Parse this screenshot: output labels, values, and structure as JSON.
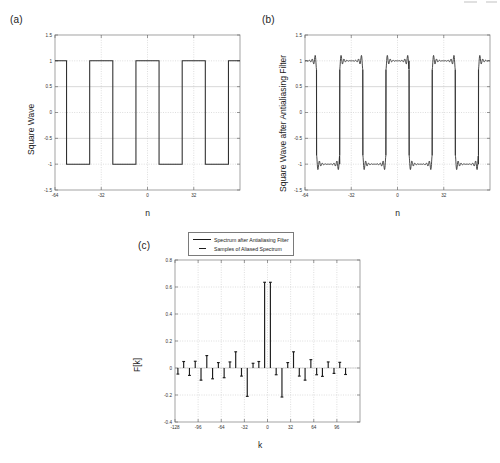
{
  "figure": {
    "panels": [
      {
        "id": "a",
        "label": "(a)"
      },
      {
        "id": "b",
        "label": "(b)"
      },
      {
        "id": "c",
        "label": "(c)"
      }
    ]
  },
  "legend": {
    "items": [
      {
        "label": "Spectrum after Antialiasing Filter",
        "style": "solid"
      },
      {
        "label": "Samples of Aliased Spectrum",
        "style": "dash"
      }
    ]
  },
  "chart_data": [
    {
      "type": "line",
      "panel": "a",
      "title": "",
      "xlabel": "n",
      "ylabel": "Square Wave",
      "xlim": [
        -64,
        64
      ],
      "ylim": [
        -1.5,
        1.5
      ],
      "xticks": [
        -64,
        -32,
        0,
        32
      ],
      "xticklabels": [
        "-64",
        "-32",
        "0",
        "32"
      ],
      "yticks": [
        -1.5,
        -1,
        -0.5,
        0,
        0.5,
        1,
        1.5
      ],
      "yticklabels": [
        "-1.5",
        "-1",
        "-0.5",
        "0",
        "0.5",
        "1",
        "1.5"
      ],
      "grid": true,
      "description": "Ideal square wave, amplitude +/-1, period 32 samples",
      "period": 32,
      "amplitude": 1,
      "series": [
        {
          "name": "Square Wave",
          "x": [
            -64,
            -56,
            -56,
            -40,
            -40,
            -24,
            -24,
            -8,
            -8,
            8,
            8,
            24,
            24,
            40,
            40,
            56,
            56,
            64
          ],
          "y": [
            1,
            1,
            -1,
            -1,
            1,
            1,
            -1,
            -1,
            1,
            1,
            -1,
            -1,
            1,
            1,
            -1,
            -1,
            1,
            1
          ]
        }
      ]
    },
    {
      "type": "line",
      "panel": "b",
      "title": "",
      "xlabel": "n",
      "ylabel": "Square Wave after Antialiasing Filter",
      "xlim": [
        -64,
        64
      ],
      "ylim": [
        -1.5,
        1.5
      ],
      "xticks": [
        -64,
        -32,
        0,
        32
      ],
      "xticklabels": [
        "-64",
        "-32",
        "0",
        "32"
      ],
      "yticks": [
        -1.5,
        -1,
        -0.5,
        0,
        0.5,
        1,
        1.5
      ],
      "yticklabels": [
        "-1.5",
        "-1",
        "-0.5",
        "0",
        "0.5",
        "1",
        "1.5"
      ],
      "grid": true,
      "description": "Square wave after antialiasing filter showing Gibbs ringing near each transition",
      "period": 32,
      "amplitude": 1,
      "gibbs_overshoot": 0.18,
      "ringing_decay": 0.55,
      "ringing_halfwidth": 7,
      "transitions": [
        -56,
        -40,
        -24,
        -8,
        8,
        24,
        40,
        56
      ],
      "levels": [
        1,
        -1,
        1,
        -1,
        1,
        -1,
        1,
        -1,
        1
      ]
    },
    {
      "type": "bar",
      "panel": "c",
      "title": "",
      "xlabel": "k",
      "ylabel": "F[k]",
      "xlim": [
        -128,
        128
      ],
      "ylim": [
        -0.4,
        0.8
      ],
      "xticks": [
        -128,
        -96,
        -64,
        -32,
        0,
        32,
        64,
        96
      ],
      "xticklabels": [
        "-128",
        "-96",
        "-64",
        "-32",
        "0",
        "32",
        "64",
        "96"
      ],
      "yticks": [
        -0.4,
        -0.2,
        0,
        0.2,
        0.4,
        0.6,
        0.8
      ],
      "yticklabels": [
        "-0.4",
        "-0.2",
        "0",
        "0.2",
        "0.4",
        "0.6",
        "0.8"
      ],
      "grid": true,
      "description": "Stem plot of spectrum after antialiasing filter with samples of aliased spectrum",
      "stems": [
        {
          "k": -124,
          "v": -0.045
        },
        {
          "k": -116,
          "v": 0.048
        },
        {
          "k": -108,
          "v": -0.055
        },
        {
          "k": -100,
          "v": 0.05
        },
        {
          "k": -92,
          "v": -0.09
        },
        {
          "k": -84,
          "v": 0.092
        },
        {
          "k": -76,
          "v": -0.08
        },
        {
          "k": -68,
          "v": 0.04
        },
        {
          "k": -60,
          "v": -0.072
        },
        {
          "k": -52,
          "v": 0.045
        },
        {
          "k": -44,
          "v": 0.12
        },
        {
          "k": -36,
          "v": -0.06
        },
        {
          "k": -28,
          "v": -0.21
        },
        {
          "k": -20,
          "v": 0.035
        },
        {
          "k": -12,
          "v": 0.048
        },
        {
          "k": -4,
          "v": 0.635
        },
        {
          "k": 4,
          "v": 0.635
        },
        {
          "k": 12,
          "v": -0.05
        },
        {
          "k": 20,
          "v": -0.215
        },
        {
          "k": 28,
          "v": 0.04
        },
        {
          "k": 36,
          "v": 0.12
        },
        {
          "k": 44,
          "v": -0.06
        },
        {
          "k": 52,
          "v": -0.09
        },
        {
          "k": 60,
          "v": 0.062
        },
        {
          "k": 68,
          "v": -0.05
        },
        {
          "k": 76,
          "v": -0.062
        },
        {
          "k": 84,
          "v": 0.045
        },
        {
          "k": 92,
          "v": -0.04
        },
        {
          "k": 100,
          "v": 0.042
        },
        {
          "k": 108,
          "v": -0.048
        }
      ]
    }
  ]
}
